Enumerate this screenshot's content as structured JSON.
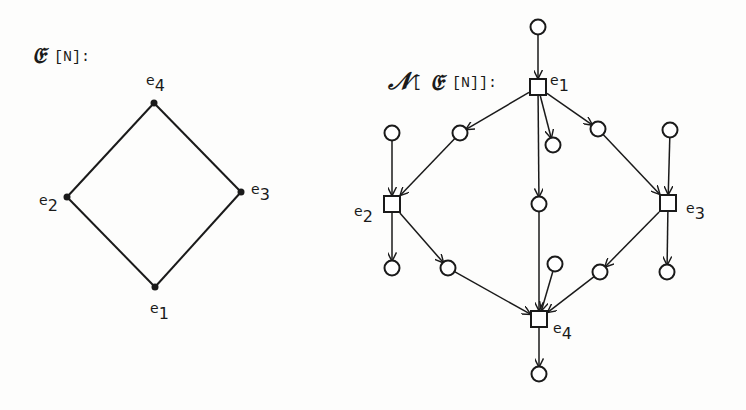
{
  "left_graph": {
    "title_script": "𝔈",
    "title_rest": "[N]:",
    "nodes": [
      {
        "id": "e1",
        "label": "e",
        "sub": "1",
        "x": 155,
        "y": 287
      },
      {
        "id": "e2",
        "label": "e",
        "sub": "2",
        "x": 67,
        "y": 197
      },
      {
        "id": "e3",
        "label": "e",
        "sub": "3",
        "x": 241,
        "y": 192
      },
      {
        "id": "e4",
        "label": "e",
        "sub": "4",
        "x": 154,
        "y": 103
      }
    ],
    "edges": [
      [
        "e1",
        "e2"
      ],
      [
        "e1",
        "e3"
      ],
      [
        "e2",
        "e4"
      ],
      [
        "e3",
        "e4"
      ]
    ]
  },
  "right_net": {
    "title_script_n": "𝒩",
    "title_open": "[",
    "title_script_e": "𝔈",
    "title_rest": "[N]]:",
    "transitions": [
      {
        "id": "e1",
        "label": "e",
        "sub": "1",
        "x": 538,
        "y": 87
      },
      {
        "id": "e2",
        "label": "e",
        "sub": "2",
        "x": 392,
        "y": 204
      },
      {
        "id": "e3",
        "label": "e",
        "sub": "3",
        "x": 668,
        "y": 203
      },
      {
        "id": "e4",
        "label": "e",
        "sub": "4",
        "x": 539,
        "y": 319
      }
    ],
    "places": [
      {
        "id": "p_top",
        "x": 538,
        "y": 27
      },
      {
        "id": "p_e2_in",
        "x": 392,
        "y": 133
      },
      {
        "id": "p_e1e2",
        "x": 460,
        "y": 133
      },
      {
        "id": "p_e1_out",
        "x": 553,
        "y": 145
      },
      {
        "id": "p_e1e3",
        "x": 598,
        "y": 129
      },
      {
        "id": "p_e3_in",
        "x": 670,
        "y": 130
      },
      {
        "id": "p_e1e4",
        "x": 539,
        "y": 204
      },
      {
        "id": "p_e2_out",
        "x": 392,
        "y": 268
      },
      {
        "id": "p_e2e4",
        "x": 448,
        "y": 268
      },
      {
        "id": "p_e4_in",
        "x": 555,
        "y": 264
      },
      {
        "id": "p_e3e4",
        "x": 600,
        "y": 272
      },
      {
        "id": "p_e3_out",
        "x": 667,
        "y": 272
      },
      {
        "id": "p_bottom",
        "x": 539,
        "y": 374
      }
    ],
    "arcs": [
      [
        "p_top",
        "e1"
      ],
      [
        "e1",
        "p_e1e2"
      ],
      [
        "p_e1e2",
        "e2"
      ],
      [
        "e1",
        "p_e1_out"
      ],
      [
        "e1",
        "p_e1e3"
      ],
      [
        "p_e1e3",
        "e3"
      ],
      [
        "e1",
        "p_e1e4"
      ],
      [
        "p_e1e4",
        "e4"
      ],
      [
        "p_e2_in",
        "e2"
      ],
      [
        "p_e3_in",
        "e3"
      ],
      [
        "e2",
        "p_e2_out"
      ],
      [
        "e2",
        "p_e2e4"
      ],
      [
        "p_e2e4",
        "e4"
      ],
      [
        "e3",
        "p_e3e4"
      ],
      [
        "p_e3e4",
        "e4"
      ],
      [
        "e3",
        "p_e3_out"
      ],
      [
        "p_e4_in",
        "e4"
      ],
      [
        "e4",
        "p_bottom"
      ]
    ]
  },
  "colors": {
    "ink": "#1a1a1a",
    "paper": "#fdfdfc"
  }
}
